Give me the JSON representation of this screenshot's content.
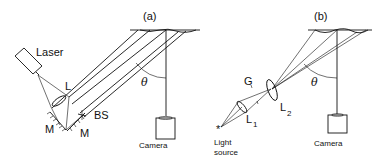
{
  "figure": {
    "panels": [
      {
        "id": "a",
        "label": "(a)",
        "components": {
          "laser": "Laser",
          "lens": "L",
          "mirror_1": "M",
          "mirror_2": "M",
          "beam_splitter": "BS",
          "angle": "θ",
          "camera": "Camera"
        }
      },
      {
        "id": "b",
        "label": "(b)",
        "components": {
          "grating": "G",
          "lens_1": "L",
          "lens_1_sub": "1",
          "lens_2": "L",
          "lens_2_sub": "2",
          "light_source_line1": "Light",
          "light_source_line2": "source",
          "light_source_symbol": "*",
          "angle": "θ",
          "camera": "Camera"
        }
      }
    ]
  },
  "colors": {
    "ink": "#111111",
    "background": "#ffffff"
  }
}
